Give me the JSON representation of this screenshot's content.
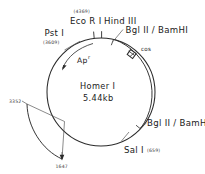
{
  "figure": {
    "type": "plasmid-map",
    "plasmid_name": "Homer I",
    "plasmid_size": "5.44kb",
    "gene_label": "Ap",
    "gene_superscript": "r",
    "cos_label": "cos"
  },
  "sites": {
    "pst_i": {
      "name": "Pst I",
      "position": "(3609)"
    },
    "eco_ri": {
      "name": "Eco R I",
      "position": "(4369)"
    },
    "hind_iii": {
      "name": "Hind III",
      "position": ""
    },
    "bgl_bam_top": {
      "name": "Bgl II / BamHI",
      "position": ""
    },
    "bgl_bam_bottom": {
      "name": "Bgl II / BamHI",
      "position": ""
    },
    "sal_i": {
      "name": "Sal I",
      "position": "(659)"
    }
  },
  "insert_arc": {
    "start_label": "3352",
    "end_label": "1647"
  },
  "colors": {
    "line": "#2b2b2b",
    "text": "#1a1a1a",
    "small_text": "#3a3a3a",
    "background": "#ffffff",
    "cos_box": "#2b2b2b"
  }
}
